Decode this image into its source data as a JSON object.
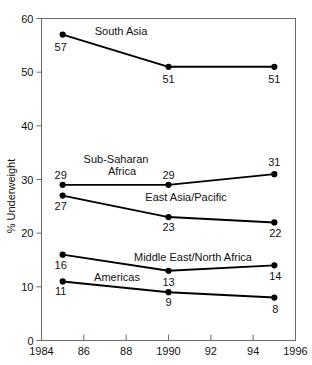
{
  "chart_data": {
    "type": "line",
    "title": "",
    "xlabel": "",
    "ylabel": "% Underweight",
    "xlim": [
      1984,
      1996
    ],
    "ylim": [
      0,
      60
    ],
    "grid": false,
    "legend_position": "inline-annotations",
    "x": [
      1985,
      1990,
      1995
    ],
    "xticks": [
      1984,
      1986,
      1988,
      1990,
      1992,
      1994,
      1996
    ],
    "xticklabels": [
      "1984",
      "86",
      "88",
      "1990",
      "92",
      "94",
      "1996"
    ],
    "yticks": [
      0,
      10,
      20,
      30,
      40,
      50,
      60
    ],
    "yticklabels": [
      "0",
      "10",
      "20",
      "30",
      "40",
      "50",
      "60"
    ],
    "series": [
      {
        "name": "South Asia",
        "values": [
          57,
          51,
          51
        ],
        "point_labels": [
          "57",
          "51",
          "51"
        ],
        "color": "#000000"
      },
      {
        "name": "Sub-Saharan Africa",
        "values": [
          29,
          29,
          31
        ],
        "point_labels": [
          "29",
          "29",
          "31"
        ],
        "color": "#000000"
      },
      {
        "name": "East Asia/Pacific",
        "values": [
          27,
          23,
          22
        ],
        "point_labels": [
          "27",
          "23",
          "22"
        ],
        "color": "#000000"
      },
      {
        "name": "Middle East/North Africa",
        "values": [
          16,
          13,
          14
        ],
        "point_labels": [
          "16",
          "13",
          "14"
        ],
        "color": "#000000"
      },
      {
        "name": "Americas",
        "values": [
          11,
          9,
          8
        ],
        "point_labels": [
          "11",
          "9",
          "8"
        ],
        "color": "#000000"
      }
    ],
    "annotations": [
      {
        "text": "South Asia",
        "x": 121,
        "y": 35
      },
      {
        "text": "Sub-Saharan",
        "x": 116,
        "y": 163
      },
      {
        "text": "Africa",
        "x": 122,
        "y": 175
      },
      {
        "text": "East Asia/Pacific",
        "x": 186,
        "y": 201
      },
      {
        "text": "Middle East/North Africa",
        "x": 193,
        "y": 261
      },
      {
        "text": "Americas",
        "x": 117,
        "y": 281
      }
    ]
  }
}
